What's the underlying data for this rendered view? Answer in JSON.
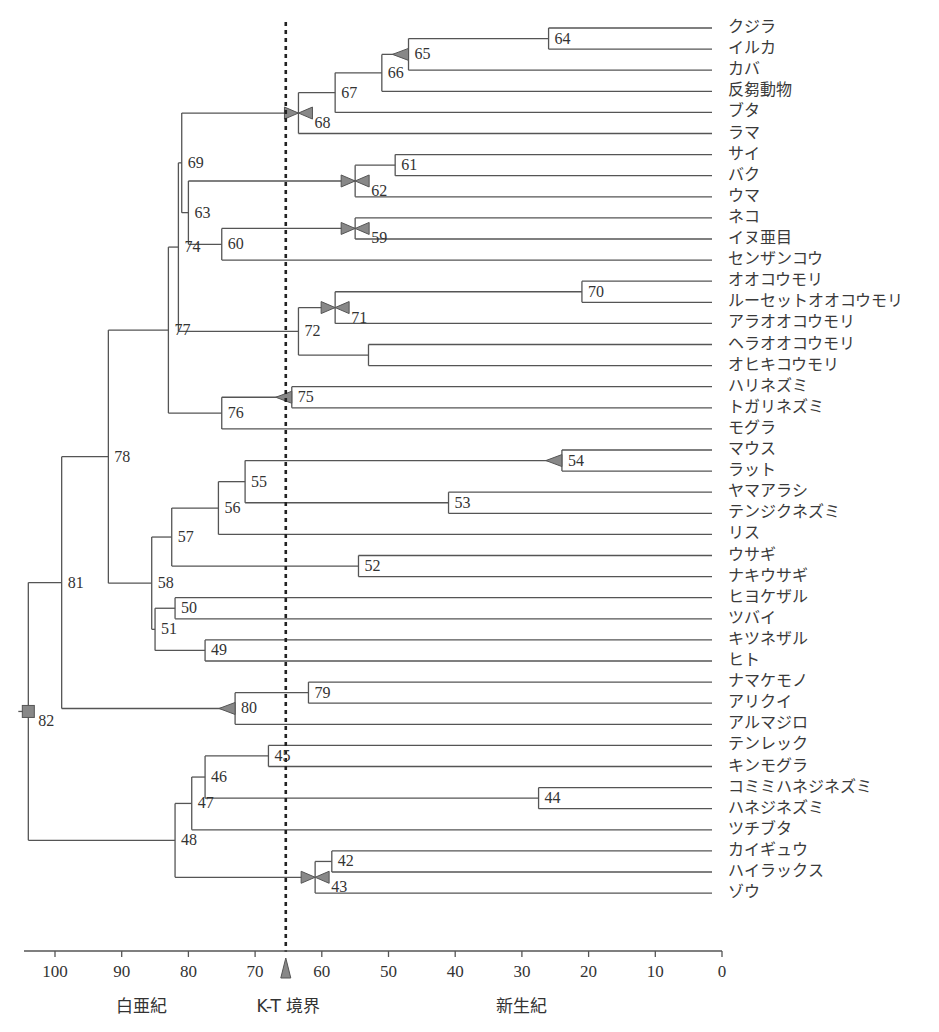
{
  "chart_data": {
    "type": "dendrogram",
    "title": "",
    "xlabel": "Ma (million years ago)",
    "x_axis": {
      "ticks": [
        100,
        90,
        80,
        70,
        60,
        50,
        40,
        30,
        20,
        10,
        0
      ],
      "range": [
        105,
        0
      ]
    },
    "eras": [
      {
        "label": "白亜紀",
        "position": 87
      },
      {
        "label": "K-T 境界",
        "position": 65
      },
      {
        "label": "新生紀",
        "position": 30
      }
    ],
    "kt_boundary": 65.4,
    "leaves": [
      "クジラ",
      "イルカ",
      "カバ",
      "反芻動物",
      "ブタ",
      "ラマ",
      "サイ",
      "バク",
      "ウマ",
      "ネコ",
      "イヌ亜目",
      "センザンコウ",
      "オオコウモリ",
      "ルーセットオオコウモリ",
      "アラオオコウモリ",
      "ヘラオオコウモリ",
      "オヒキコウモリ",
      "ハリネズミ",
      "トガリネズミ",
      "モグラ",
      "マウス",
      "ラット",
      "ヤマアラシ",
      "テンジクネズミ",
      "リス",
      "ウサギ",
      "ナキウサギ",
      "ヒヨケザル",
      "ツバイ",
      "キツネザル",
      "ヒト",
      "ナマケモノ",
      "アリクイ",
      "アルマジロ",
      "テンレック",
      "キンモグラ",
      "コミミハネジネズミ",
      "ハネジネズミ",
      "ツチブタ",
      "カイギュウ",
      "ハイラックス",
      "ゾウ"
    ],
    "nodes": [
      {
        "id": "64",
        "age": 26,
        "children": [
          "L0",
          "L1"
        ]
      },
      {
        "id": "65",
        "age": 47,
        "children": [
          "64",
          "L2"
        ],
        "marker": "triangle-left"
      },
      {
        "id": "66",
        "age": 51,
        "children": [
          "65",
          "L3"
        ]
      },
      {
        "id": "67",
        "age": 58,
        "children": [
          "66",
          "L4"
        ]
      },
      {
        "id": "68",
        "age": 63.5,
        "children": [
          "67",
          "L5"
        ],
        "marker": "bowtie"
      },
      {
        "id": "61",
        "age": 49,
        "children": [
          "L6",
          "L7"
        ]
      },
      {
        "id": "62",
        "age": 55,
        "children": [
          "61",
          "L8"
        ],
        "marker": "bowtie"
      },
      {
        "id": "59",
        "age": 55,
        "children": [
          "L9",
          "L10"
        ],
        "marker": "bowtie"
      },
      {
        "id": "60",
        "age": 75,
        "children": [
          "59",
          "L11"
        ]
      },
      {
        "id": "63",
        "age": 80,
        "children": [
          "62",
          "60"
        ]
      },
      {
        "id": "69",
        "age": 81,
        "children": [
          "68",
          "63"
        ]
      },
      {
        "id": "70",
        "age": 21,
        "children": [
          "L12",
          "L13"
        ]
      },
      {
        "id": "71",
        "age": 58,
        "children": [
          "70",
          "L14"
        ],
        "marker": "bowtie"
      },
      {
        "id": "73",
        "age": 53,
        "children": [
          "L15",
          "L16"
        ]
      },
      {
        "id": "72",
        "age": 63.5,
        "children": [
          "71",
          "73"
        ]
      },
      {
        "id": "74",
        "age": 81.5,
        "children": [
          "69",
          "72"
        ]
      },
      {
        "id": "75",
        "age": 64.5,
        "children": [
          "L17",
          "L18"
        ],
        "marker": "triangle-left"
      },
      {
        "id": "76",
        "age": 75,
        "children": [
          "75",
          "L19"
        ]
      },
      {
        "id": "77",
        "age": 83,
        "children": [
          "74",
          "76"
        ]
      },
      {
        "id": "54",
        "age": 24,
        "children": [
          "L20",
          "L21"
        ],
        "marker": "triangle-left"
      },
      {
        "id": "53",
        "age": 41,
        "children": [
          "L22",
          "L23"
        ]
      },
      {
        "id": "55",
        "age": 71.5,
        "children": [
          "54",
          "53"
        ]
      },
      {
        "id": "56",
        "age": 75.5,
        "children": [
          "55",
          "L24"
        ]
      },
      {
        "id": "52",
        "age": 54.5,
        "children": [
          "L25",
          "L26"
        ]
      },
      {
        "id": "57",
        "age": 82.5,
        "children": [
          "56",
          "52"
        ]
      },
      {
        "id": "50",
        "age": 82,
        "children": [
          "L27",
          "L28"
        ]
      },
      {
        "id": "49",
        "age": 77.5,
        "children": [
          "L29",
          "L30"
        ]
      },
      {
        "id": "51",
        "age": 85,
        "children": [
          "50",
          "49"
        ]
      },
      {
        "id": "58",
        "age": 85.5,
        "children": [
          "57",
          "51"
        ]
      },
      {
        "id": "78",
        "age": 92,
        "children": [
          "77",
          "58"
        ]
      },
      {
        "id": "79",
        "age": 62,
        "children": [
          "L31",
          "L32"
        ]
      },
      {
        "id": "80",
        "age": 73,
        "children": [
          "79",
          "L33"
        ],
        "marker": "triangle-left"
      },
      {
        "id": "81",
        "age": 99,
        "children": [
          "78",
          "80"
        ]
      },
      {
        "id": "45",
        "age": 68,
        "children": [
          "L34",
          "L35"
        ]
      },
      {
        "id": "44",
        "age": 27.5,
        "children": [
          "L36",
          "L37"
        ]
      },
      {
        "id": "46",
        "age": 77.5,
        "children": [
          "45",
          "44"
        ]
      },
      {
        "id": "47",
        "age": 79.5,
        "children": [
          "46",
          "L38"
        ]
      },
      {
        "id": "42",
        "age": 58.5,
        "children": [
          "L39",
          "L40"
        ]
      },
      {
        "id": "43",
        "age": 61,
        "children": [
          "42",
          "L41"
        ],
        "marker": "bowtie"
      },
      {
        "id": "48",
        "age": 82,
        "children": [
          "47",
          "43"
        ]
      },
      {
        "id": "82",
        "age": 104,
        "children": [
          "81",
          "48"
        ],
        "marker": "square"
      }
    ]
  },
  "axis": {
    "ticks": [
      "100",
      "90",
      "80",
      "70",
      "60",
      "50",
      "40",
      "30",
      "20",
      "10",
      "0"
    ],
    "eras": {
      "cretaceous": "白亜紀",
      "kt": "K-T 境界",
      "cenozoic": "新生紀"
    }
  },
  "colors": {
    "line": "#555555",
    "marker": "#888888",
    "dotted": "#222222",
    "text": "#333333"
  }
}
